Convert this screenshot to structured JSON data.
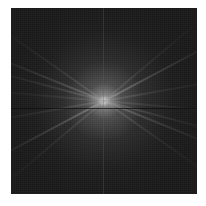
{
  "image": {
    "type": "fft-magnitude-spectrum",
    "background_color": "#ffffff",
    "frame_color": "#1a1a1a",
    "center_color": "#f2f2f2",
    "streak_angles_deg": [
      -28,
      22,
      15,
      -10,
      35,
      -40,
      5
    ]
  }
}
